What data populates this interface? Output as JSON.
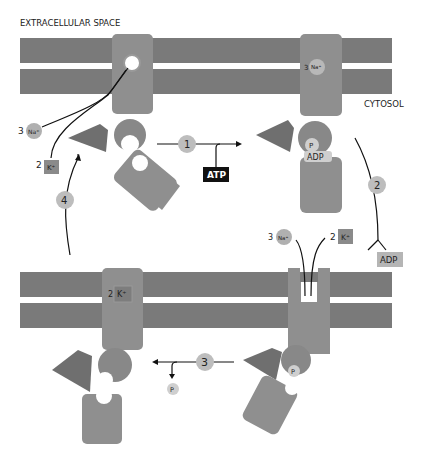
{
  "labels": {
    "extracellular": "EXTRACELLULAR SPACE",
    "cytosol": "CYTOSOL"
  },
  "steps": [
    "1",
    "2",
    "3",
    "4"
  ],
  "ions": {
    "na_count": "3",
    "na_symbol": "Na⁺",
    "k_count": "2",
    "k_symbol": "K⁺"
  },
  "molecules": {
    "atp": "ATP",
    "adp": "ADP",
    "phosphate": "P"
  },
  "colors": {
    "membrane": "#7a7a7a",
    "protein": "#8f8f8f",
    "protein_dark": "#6b6b6b",
    "step_circle": "#bdbdbd",
    "atp_bg": "#111111",
    "adp_bg": "#b5b5b5",
    "k_box": "#8a8a8a"
  }
}
